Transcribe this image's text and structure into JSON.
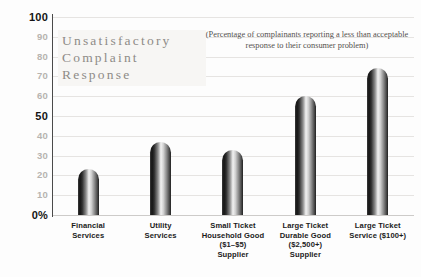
{
  "chart_data": {
    "type": "bar",
    "title": "Unsatisfactory\nComplaint\nResponse",
    "subtitle": "(Percentage of complainants reporting a less than acceptable response to their consumer problem)",
    "xlabel": "",
    "ylabel": "",
    "ylim": [
      0,
      100
    ],
    "grid": true,
    "legend": "none",
    "categories": [
      "Financial\nServices",
      "Utility\nServices",
      "Small Ticket\nHousehold Good\n($1–$5)\nSupplier",
      "Large Ticket\nDurable Good\n($2,500+)\nSupplier",
      "Large Ticket\nService ($100+)"
    ],
    "values": [
      23,
      37,
      33,
      60,
      74
    ],
    "y_ticks": [
      {
        "value": 100,
        "label": "100",
        "major": true
      },
      {
        "value": 90,
        "label": "90",
        "major": false
      },
      {
        "value": 80,
        "label": "80",
        "major": false
      },
      {
        "value": 70,
        "label": "70",
        "major": false
      },
      {
        "value": 60,
        "label": "60",
        "major": false
      },
      {
        "value": 50,
        "label": "50",
        "major": true
      },
      {
        "value": 40,
        "label": "40",
        "major": false
      },
      {
        "value": 30,
        "label": "30",
        "major": false
      },
      {
        "value": 20,
        "label": "20",
        "major": false
      },
      {
        "value": 10,
        "label": "10",
        "major": false
      },
      {
        "value": 0,
        "label": "0%",
        "major": true
      }
    ],
    "colors": {
      "background": "#fdfdfd",
      "gridline": "#e6e4e2",
      "axis": "#4a4a4a",
      "bar_dark": "#141414",
      "bar_light": "#f2f2f2",
      "title_text": "#8e8b87",
      "tick_minor": "#b7b4b0",
      "tick_major": "#141414"
    }
  }
}
